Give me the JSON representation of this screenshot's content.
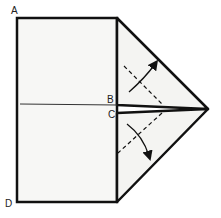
{
  "diagram": {
    "type": "origami-fold-instruction",
    "labels": {
      "a": "A",
      "b": "B",
      "c": "C",
      "d": "D"
    },
    "colors": {
      "paper": "#f7f7f5",
      "stroke": "#111111",
      "background": "#ffffff"
    }
  }
}
